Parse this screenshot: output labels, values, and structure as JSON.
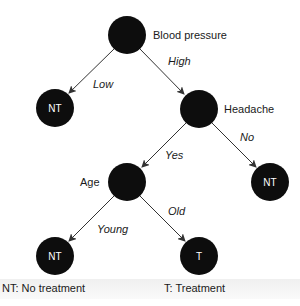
{
  "diagram": {
    "type": "decision-tree",
    "colors": {
      "node_fill": "#0d0d0d",
      "edge": "#333333",
      "leaf_text": "#ffffff",
      "text": "#1a1a1a"
    },
    "nodes": [
      {
        "id": "blood_pressure",
        "label": "Blood pressure",
        "leaf_text": "",
        "cx": 127,
        "cy": 35
      },
      {
        "id": "nt_low",
        "label": "",
        "leaf_text": "NT",
        "cx": 55,
        "cy": 108
      },
      {
        "id": "headache",
        "label": "Headache",
        "leaf_text": "",
        "cx": 199,
        "cy": 109
      },
      {
        "id": "age",
        "label": "Age",
        "leaf_text": "",
        "cx": 127,
        "cy": 182
      },
      {
        "id": "nt_no",
        "label": "",
        "leaf_text": "NT",
        "cx": 270,
        "cy": 182
      },
      {
        "id": "nt_young",
        "label": "",
        "leaf_text": "NT",
        "cx": 55,
        "cy": 256
      },
      {
        "id": "t_old",
        "label": "",
        "leaf_text": "T",
        "cx": 199,
        "cy": 256
      }
    ],
    "edges": [
      {
        "from": "blood_pressure",
        "to": "nt_low",
        "label": "Low"
      },
      {
        "from": "blood_pressure",
        "to": "headache",
        "label": "High"
      },
      {
        "from": "headache",
        "to": "age",
        "label": "Yes"
      },
      {
        "from": "headache",
        "to": "nt_no",
        "label": "No"
      },
      {
        "from": "age",
        "to": "nt_young",
        "label": "Young"
      },
      {
        "from": "age",
        "to": "t_old",
        "label": "Old"
      }
    ]
  },
  "legend": {
    "nt": "NT: No treatment",
    "t": "T: Treatment"
  }
}
